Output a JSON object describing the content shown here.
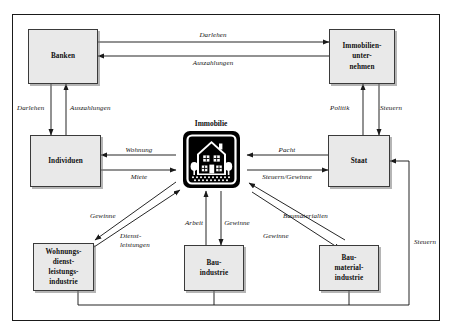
{
  "diagram": {
    "title_visible": false,
    "frame": {
      "border_color": "#1a1a1a"
    },
    "colors": {
      "node_fill": "#e9e9e9",
      "node_border": "#3a3a3a",
      "arrow": "#1a1a1a",
      "icon": "#000000",
      "text": "#101010"
    },
    "nodes": [
      {
        "id": "banken",
        "label": "Banken",
        "lines": [
          "Banken"
        ]
      },
      {
        "id": "immobilien",
        "label": "Immobilien-unter-nehmen",
        "lines": [
          "Immobilien-",
          "unter-",
          "nehmen"
        ]
      },
      {
        "id": "individuen",
        "label": "Individuen",
        "lines": [
          "Individuen"
        ]
      },
      {
        "id": "staat",
        "label": "Staat",
        "lines": [
          "Staat"
        ]
      },
      {
        "id": "wohnungs",
        "label": "Wohnungs-dienst-leistungs-industrie",
        "lines": [
          "Wohnungs-",
          "dienst-",
          "leistungs-",
          "industrie"
        ]
      },
      {
        "id": "bauindustrie",
        "label": "Bau-industrie",
        "lines": [
          "Bau-",
          "industrie"
        ]
      },
      {
        "id": "baumaterial",
        "label": "Bau-material-industrie",
        "lines": [
          "Bau-",
          "material-",
          "industrie"
        ]
      }
    ],
    "center": {
      "id": "immobilie",
      "label": "Immobilie",
      "icon": "house-icon"
    },
    "edges": [
      {
        "id": "e1",
        "from": "banken",
        "to": "immobilien",
        "label": "Darlehen"
      },
      {
        "id": "e2",
        "from": "immobilien",
        "to": "banken",
        "label": "Auszahlungen"
      },
      {
        "id": "e3",
        "from": "banken",
        "to": "individuen",
        "label": "Darlehen"
      },
      {
        "id": "e4",
        "from": "individuen",
        "to": "banken",
        "label": "Auszahlungen"
      },
      {
        "id": "e5",
        "from": "staat",
        "to": "immobilien",
        "label": "Politik"
      },
      {
        "id": "e6",
        "from": "immobilien",
        "to": "staat",
        "label": "Steuern"
      },
      {
        "id": "e7",
        "from": "immobilie",
        "to": "individuen",
        "label": "Wohnung"
      },
      {
        "id": "e8",
        "from": "individuen",
        "to": "immobilie",
        "label": "Miete"
      },
      {
        "id": "e9",
        "from": "staat",
        "to": "immobilie",
        "label": "Pacht"
      },
      {
        "id": "e10",
        "from": "immobilie",
        "to": "staat",
        "label": "Steuern/Gewinne"
      },
      {
        "id": "e11",
        "from": "immobilie",
        "to": "wohnungs",
        "label": "Gewinne"
      },
      {
        "id": "e12",
        "from": "wohnungs",
        "to": "immobilie",
        "label": "Dienst-leistungen"
      },
      {
        "id": "e13",
        "from": "bauindustrie",
        "to": "immobilie",
        "label": "Arbeit"
      },
      {
        "id": "e14",
        "from": "immobilie",
        "to": "bauindustrie",
        "label": "Gewinne"
      },
      {
        "id": "e15",
        "from": "baumaterial",
        "to": "immobilie",
        "label": "Baumaterialien"
      },
      {
        "id": "e16",
        "from": "immobilie",
        "to": "baumaterial",
        "label": "Gewinne"
      },
      {
        "id": "e17",
        "from": "industries",
        "to": "staat",
        "label": "Steuern"
      }
    ],
    "labels": {
      "darlehen_top": "Darlehen",
      "auszahlungen_top": "Auszahlungen",
      "darlehen_left": "Darlehen",
      "auszahlungen_left": "Auszahlungen",
      "politik": "Politik",
      "steuern_top_right": "Steuern",
      "wohnung": "Wohnung",
      "miete": "Miete",
      "pacht": "Pacht",
      "steuern_gewinne": "Steuern/Gewinne",
      "gewinne_left": "Gewinne",
      "dienst": "Dienst-",
      "leistungen": "leistungen",
      "arbeit": "Arbeit",
      "gewinne_mid": "Gewinne",
      "baumaterialien": "Baumaterialien",
      "gewinne_right": "Gewinne",
      "steuern_far_right": "Steuern"
    }
  }
}
